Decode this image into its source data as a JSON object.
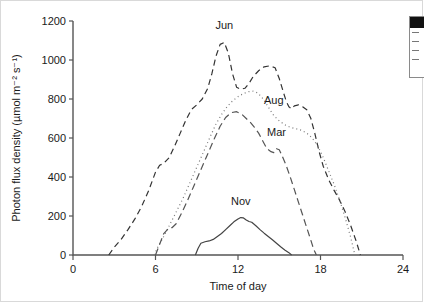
{
  "figure": {
    "kind": "line-chart",
    "background": "#ffffff",
    "line_color": "#333333"
  },
  "legend_panel": {
    "visible": true,
    "clipped": true,
    "header_color": "#111111",
    "rows": [
      "",
      "",
      "",
      ""
    ]
  },
  "chart_data": {
    "type": "line",
    "title": "",
    "xlabel": "Time of day",
    "ylabel": "Photon flux density (µmol m⁻² s⁻¹)",
    "xlim": [
      0,
      24
    ],
    "ylim": [
      0,
      1200
    ],
    "xticks": [
      0,
      6,
      12,
      18,
      24
    ],
    "yticks": [
      0,
      200,
      400,
      600,
      800,
      1000,
      1200
    ],
    "xtick_labels": [
      "0",
      "6",
      "12",
      "18",
      "24"
    ],
    "ytick_labels": [
      "0",
      "200",
      "400",
      "600",
      "800",
      "1000",
      "1200"
    ],
    "grid": false,
    "legend_position": "inline-labels",
    "series": [
      {
        "name": "Jun",
        "label": "Jun",
        "dash": "6,4",
        "color": "#333333",
        "width": 1.2,
        "label_x": 11.0,
        "label_y": 1160,
        "x": [
          2.6,
          3.0,
          3.5,
          4.0,
          4.5,
          5.0,
          5.5,
          6.0,
          6.3,
          6.6,
          7.0,
          7.4,
          7.8,
          8.2,
          8.6,
          9.0,
          9.4,
          9.8,
          10.1,
          10.4,
          10.7,
          11.0,
          11.3,
          11.6,
          11.9,
          12.2,
          12.5,
          12.8,
          13.1,
          13.5,
          13.9,
          14.3,
          14.7,
          15.0,
          15.3,
          15.5,
          15.7,
          15.9,
          16.1,
          16.4,
          16.7,
          17.0,
          17.3,
          17.6,
          17.9,
          18.2,
          18.6,
          19.0,
          19.4,
          19.8,
          20.2,
          20.6,
          20.9
        ],
        "y": [
          0,
          40,
          80,
          130,
          185,
          250,
          330,
          425,
          460,
          470,
          500,
          560,
          625,
          690,
          745,
          770,
          800,
          855,
          930,
          1020,
          1080,
          1090,
          1035,
          930,
          860,
          850,
          855,
          880,
          915,
          945,
          965,
          970,
          960,
          905,
          835,
          790,
          760,
          750,
          765,
          770,
          760,
          745,
          700,
          620,
          530,
          455,
          385,
          330,
          280,
          220,
          150,
          70,
          0
        ]
      },
      {
        "name": "Aug",
        "label": "Aug",
        "dash": "1,3",
        "color": "#777777",
        "width": 1.2,
        "label_x": 14.6,
        "label_y": 775,
        "x": [
          5.9,
          6.2,
          6.6,
          7.0,
          7.5,
          8.0,
          8.5,
          9.0,
          9.5,
          10.0,
          10.4,
          10.8,
          11.2,
          11.6,
          12.0,
          12.4,
          12.8,
          13.1,
          13.4,
          13.7,
          14.0,
          14.3,
          14.6,
          15.0,
          15.4,
          15.8,
          16.2,
          16.6,
          17.0,
          17.4,
          17.8,
          18.2,
          18.6,
          19.0,
          19.4,
          19.8,
          20.2,
          20.5
        ],
        "y": [
          0,
          45,
          95,
          150,
          220,
          290,
          370,
          450,
          530,
          610,
          672,
          720,
          760,
          790,
          812,
          828,
          838,
          840,
          832,
          812,
          782,
          748,
          715,
          688,
          668,
          655,
          648,
          640,
          625,
          600,
          560,
          500,
          430,
          360,
          280,
          190,
          90,
          0
        ]
      },
      {
        "name": "Mar",
        "label": "Mar",
        "dash": "7,4",
        "color": "#555555",
        "width": 1.2,
        "label_x": 14.8,
        "label_y": 610,
        "x": [
          6.0,
          6.3,
          6.6,
          7.0,
          7.2,
          7.5,
          7.9,
          8.3,
          8.7,
          9.1,
          9.5,
          9.9,
          10.3,
          10.7,
          11.1,
          11.5,
          11.9,
          12.3,
          12.6,
          12.9,
          13.2,
          13.5,
          13.8,
          14.1,
          14.4,
          14.6,
          14.8,
          15.0,
          15.2,
          15.5,
          15.8,
          16.1,
          16.4,
          16.7,
          17.0,
          17.3,
          17.5,
          17.7
        ],
        "y": [
          0,
          55,
          110,
          140,
          140,
          160,
          215,
          275,
          340,
          405,
          470,
          535,
          600,
          660,
          705,
          730,
          735,
          720,
          700,
          680,
          655,
          625,
          585,
          545,
          530,
          525,
          545,
          540,
          510,
          460,
          400,
          335,
          270,
          205,
          140,
          75,
          30,
          0
        ]
      },
      {
        "name": "Nov",
        "label": "Nov",
        "dash": "none",
        "color": "#444444",
        "width": 1.2,
        "label_x": 12.2,
        "label_y": 255,
        "x": [
          8.9,
          9.1,
          9.3,
          9.6,
          9.9,
          10.2,
          10.5,
          10.8,
          11.1,
          11.4,
          11.7,
          12.0,
          12.2,
          12.4,
          12.6,
          12.8,
          13.0,
          13.3,
          13.6,
          13.9,
          14.2,
          14.5,
          14.8,
          15.1,
          15.4,
          15.7,
          15.9
        ],
        "y": [
          0,
          35,
          60,
          68,
          72,
          80,
          95,
          110,
          130,
          150,
          170,
          185,
          192,
          190,
          180,
          172,
          168,
          150,
          130,
          112,
          95,
          78,
          60,
          42,
          26,
          12,
          0
        ]
      }
    ]
  }
}
